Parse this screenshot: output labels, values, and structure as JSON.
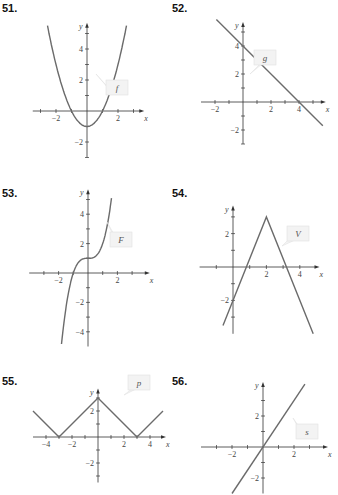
{
  "chart_data": [
    {
      "type": "line",
      "problem": "51.",
      "function_label": "f",
      "xlabel": "x",
      "ylabel": "y",
      "xlim": [
        -3.5,
        3.5
      ],
      "ylim": [
        -3,
        5.5
      ],
      "x_ticks": [
        -3,
        -2,
        -1,
        1,
        2,
        3
      ],
      "x_tick_labels": [
        "-2",
        "2"
      ],
      "x_tick_label_values": [
        -2,
        2
      ],
      "y_ticks": [
        -3,
        -2,
        -1,
        1,
        2,
        3,
        4,
        5
      ],
      "y_tick_labels": [
        "-2",
        "2",
        "4"
      ],
      "y_tick_label_values": [
        -2,
        2,
        4
      ],
      "expression": "x^2 - 1",
      "x": [
        -2.5,
        -2,
        -1.5,
        -1,
        -0.5,
        0,
        0.5,
        1,
        1.5,
        2,
        2.5
      ],
      "y": [
        5.25,
        3,
        1.25,
        0,
        -0.75,
        -1,
        -0.75,
        0,
        1.25,
        3,
        5.25
      ]
    },
    {
      "type": "line",
      "problem": "52.",
      "function_label": "g",
      "xlabel": "x",
      "ylabel": "y",
      "xlim": [
        -3,
        5.7
      ],
      "ylim": [
        -3,
        5.5
      ],
      "x_ticks": [
        -2,
        -1,
        1,
        2,
        3,
        4,
        5
      ],
      "x_tick_labels": [
        "-2",
        "2",
        "4"
      ],
      "x_tick_label_values": [
        -2,
        2,
        4
      ],
      "y_ticks": [
        -3,
        -2,
        -1,
        1,
        2,
        3,
        4,
        5
      ],
      "y_tick_labels": [
        "-2",
        "2",
        "4"
      ],
      "y_tick_label_values": [
        -2,
        2,
        4
      ],
      "expression": "4 - x",
      "x": [
        -1.9,
        5.7
      ],
      "y": [
        5.9,
        -1.7
      ]
    },
    {
      "type": "line",
      "problem": "53.",
      "function_label": "F",
      "xlabel": "x",
      "ylabel": "y",
      "xlim": [
        -4,
        4
      ],
      "ylim": [
        -5,
        5.5
      ],
      "x_ticks": [
        -3,
        -2,
        -1,
        1,
        2,
        3
      ],
      "x_tick_labels": [
        "-2",
        "2"
      ],
      "x_tick_label_values": [
        -2,
        2
      ],
      "y_ticks": [
        -4,
        -3,
        -2,
        -1,
        1,
        2,
        3,
        4,
        5
      ],
      "y_tick_labels": [
        "-4",
        "-2",
        "2",
        "4"
      ],
      "y_tick_label_values": [
        -4,
        -2,
        2,
        4
      ],
      "expression": "x^3 + 1",
      "x": [
        -1.8,
        -1.5,
        -1,
        -0.5,
        0,
        0.5,
        1,
        1.5,
        1.6
      ],
      "y": [
        -4.83,
        -2.38,
        0,
        0.88,
        1,
        1.13,
        2,
        4.38,
        5.1
      ]
    },
    {
      "type": "line",
      "problem": "54.",
      "function_label": "V",
      "xlabel": "x",
      "ylabel": "y",
      "xlim": [
        -2,
        5
      ],
      "ylim": [
        -4,
        3.5
      ],
      "x_ticks": [
        -1,
        1,
        2,
        3,
        4
      ],
      "x_tick_labels": [
        "2",
        "4"
      ],
      "x_tick_label_values": [
        2,
        4
      ],
      "y_ticks": [
        -3,
        -2,
        -1,
        1,
        2,
        3
      ],
      "y_tick_labels": [
        "-2",
        "2"
      ],
      "y_tick_label_values": [
        -2,
        2
      ],
      "expression": "3 - 2.5|x - 2|",
      "x": [
        -0.6,
        2,
        4.8
      ],
      "y": [
        -3.5,
        3,
        -4
      ]
    },
    {
      "type": "line",
      "problem": "55.",
      "function_label": "p",
      "xlabel": "x",
      "ylabel": "y",
      "xlim": [
        -5,
        5
      ],
      "ylim": [
        -3.5,
        3.5
      ],
      "x_ticks": [
        -4,
        -3,
        -2,
        -1,
        1,
        2,
        3,
        4
      ],
      "x_tick_labels": [
        "-4",
        "-2",
        "2",
        "4"
      ],
      "x_tick_label_values": [
        -4,
        -2,
        2,
        4
      ],
      "y_ticks": [
        -3,
        -2,
        -1,
        1,
        2,
        3
      ],
      "y_tick_labels": [
        "-2",
        "2"
      ],
      "y_tick_label_values": [
        -2,
        2
      ],
      "expression": "||x| - 3|",
      "x": [
        -5,
        -3,
        0,
        3,
        5
      ],
      "y": [
        2,
        0,
        3,
        0,
        2
      ]
    },
    {
      "type": "line",
      "problem": "56.",
      "function_label": "s",
      "xlabel": "x",
      "ylabel": "y",
      "xlim": [
        -4,
        4
      ],
      "ylim": [
        -3,
        4
      ],
      "x_ticks": [
        -3,
        -2,
        -1,
        1,
        2,
        3
      ],
      "x_tick_labels": [
        "-2",
        "2"
      ],
      "x_tick_label_values": [
        -2,
        2
      ],
      "y_ticks": [
        -2,
        -1,
        1,
        2,
        3
      ],
      "y_tick_labels": [
        "-2",
        "2"
      ],
      "y_tick_label_values": [
        -2,
        2
      ],
      "expression": "1.5x",
      "x": [
        -2,
        2.7
      ],
      "y": [
        -3,
        4.05
      ]
    }
  ]
}
